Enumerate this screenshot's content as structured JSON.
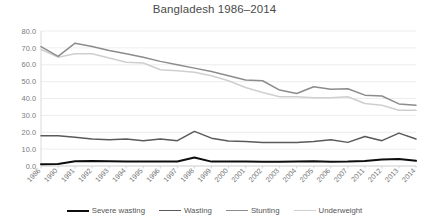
{
  "chart_data": {
    "type": "line",
    "title": "Bangladesh 1986–2014",
    "xlabel": "",
    "ylabel": "",
    "ylim": [
      0.0,
      80.0
    ],
    "yticks": [
      "0.0",
      "10.0",
      "20.0",
      "30.0",
      "40.0",
      "50.0",
      "60.0",
      "70.0",
      "80.0"
    ],
    "grid": true,
    "legend_position": "bottom",
    "categories": [
      "1986",
      "1990",
      "1991",
      "1992",
      "1993",
      "1994",
      "1995",
      "1996",
      "1997",
      "1998",
      "1999",
      "2000",
      "2001",
      "2002",
      "2003",
      "2004",
      "2005",
      "2006",
      "2007",
      "2011",
      "2012",
      "2013",
      "2014"
    ],
    "series": [
      {
        "name": "Severe wasting",
        "color": "#0d0d0d",
        "width": 2.0,
        "values": [
          1.0,
          1.2,
          2.8,
          3.0,
          2.8,
          2.6,
          2.6,
          2.6,
          2.7,
          5.0,
          2.6,
          2.6,
          2.6,
          2.5,
          2.5,
          2.6,
          2.8,
          2.5,
          2.6,
          3.0,
          3.8,
          4.2,
          3.1
        ]
      },
      {
        "name": "Wasting",
        "color": "#5a5a5a",
        "width": 1.5,
        "values": [
          18.0,
          18.0,
          17.0,
          16.0,
          15.5,
          16.0,
          15.0,
          16.0,
          15.0,
          20.5,
          16.5,
          14.8,
          14.5,
          14.0,
          14.0,
          14.0,
          14.5,
          15.5,
          14.0,
          17.5,
          15.0,
          19.5,
          16.0
        ]
      },
      {
        "name": "Stunting",
        "color": "#8c8c8c",
        "width": 1.5,
        "values": [
          70.8,
          65.0,
          72.8,
          70.8,
          68.5,
          66.5,
          64.5,
          62.0,
          60.0,
          58.0,
          56.0,
          53.5,
          51.0,
          50.5,
          45.0,
          43.0,
          47.0,
          45.5,
          45.8,
          42.0,
          41.5,
          36.8,
          36.0
        ]
      },
      {
        "name": "Underweight",
        "color": "#cfcfcf",
        "width": 1.5,
        "values": [
          69.0,
          64.5,
          66.5,
          66.5,
          64.0,
          61.5,
          61.0,
          57.0,
          56.5,
          55.5,
          53.5,
          50.5,
          46.5,
          43.5,
          41.0,
          41.0,
          40.5,
          40.5,
          41.0,
          37.0,
          36.0,
          33.0,
          33.0
        ]
      }
    ]
  }
}
